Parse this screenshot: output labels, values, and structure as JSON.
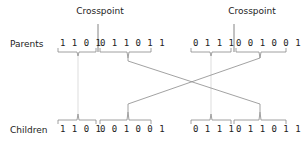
{
  "labels": {
    "crosspoint_left": "Crosspoint",
    "crosspoint_right": "Crosspoint",
    "parents": "Parents",
    "children": "Children"
  },
  "parents": [
    {
      "head": "1 1 0 1",
      "tail": "0 1 1 0 1 1"
    },
    {
      "head": "0 1 1 1",
      "tail": "0 0 1 0 0 1"
    }
  ],
  "children": [
    {
      "head": "1 1 0 1",
      "tail": "0 0 1 0 0 1"
    },
    {
      "head": "0 1 1 1",
      "tail": "0 1 1 0 1 1"
    }
  ],
  "colors": {
    "text": "#222222",
    "bracket": "#888888",
    "connector": "#8a8a8a",
    "faint_connector": "#d4d4d4"
  }
}
